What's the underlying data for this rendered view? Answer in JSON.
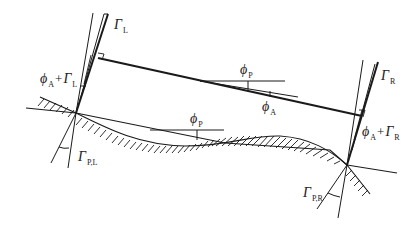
{
  "figure": {
    "type": "geometric diagram"
  },
  "colors": {
    "line": "#1a1a1a",
    "background": "#ffffff"
  },
  "labels": {
    "gamma_l": {
      "symbol": "Γ",
      "sub": "L"
    },
    "gamma_r": {
      "symbol": "Γ",
      "sub": "R"
    },
    "phi_a_plus_gamma_l": {
      "symbol1": "ϕ",
      "sub1": "A",
      "op": "+",
      "symbol2": "Γ",
      "sub2": "L"
    },
    "phi_a_plus_gamma_r": {
      "symbol1": "ϕ",
      "sub1": "A",
      "op": "+",
      "symbol2": "Γ",
      "sub2": "R"
    },
    "phi_p_upper": {
      "symbol": "ϕ",
      "sub": "P"
    },
    "phi_a": {
      "symbol": "ϕ",
      "sub": "A"
    },
    "phi_p_lower": {
      "symbol": "ϕ",
      "sub": "P"
    },
    "gamma_pl": {
      "symbol": "Γ",
      "sub": "P,L"
    },
    "gamma_pr": {
      "symbol": "Γ",
      "sub": "P,R"
    }
  }
}
